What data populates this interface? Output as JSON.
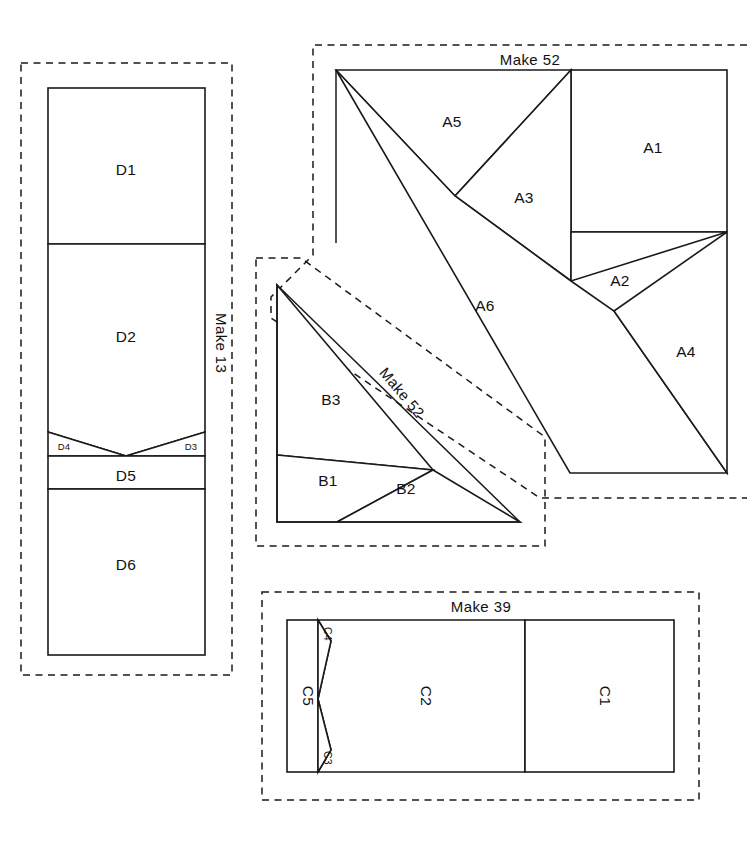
{
  "document": {
    "kind": "quilt-block-cutting-diagram",
    "width": 747,
    "height": 850,
    "background_color": "#ffffff",
    "line_color": "#1a1a1a"
  },
  "blocks": [
    {
      "id": "D",
      "name": "block-d",
      "make_label": "Make 13",
      "make_label_orientation": "vertical",
      "pieces": [
        {
          "id": "D1",
          "label": "D1"
        },
        {
          "id": "D2",
          "label": "D2"
        },
        {
          "id": "D4",
          "label": "D4"
        },
        {
          "id": "D3",
          "label": "D3"
        },
        {
          "id": "D5",
          "label": "D5"
        },
        {
          "id": "D6",
          "label": "D6"
        }
      ]
    },
    {
      "id": "A",
      "name": "block-a",
      "make_label": "Make 52",
      "make_label_orientation": "horizontal",
      "pieces": [
        {
          "id": "A5",
          "label": "A5"
        },
        {
          "id": "A1",
          "label": "A1"
        },
        {
          "id": "A3",
          "label": "A3"
        },
        {
          "id": "A2",
          "label": "A2"
        },
        {
          "id": "A6",
          "label": "A6"
        },
        {
          "id": "A4",
          "label": "A4"
        }
      ]
    },
    {
      "id": "B",
      "name": "block-b",
      "make_label": "Make 52",
      "make_label_orientation": "diagonal",
      "pieces": [
        {
          "id": "B3",
          "label": "B3"
        },
        {
          "id": "B1",
          "label": "B1"
        },
        {
          "id": "B2",
          "label": "B2"
        }
      ]
    },
    {
      "id": "C",
      "name": "block-c",
      "make_label": "Make 39",
      "make_label_orientation": "horizontal",
      "pieces": [
        {
          "id": "C5",
          "label": "C5"
        },
        {
          "id": "C4",
          "label": "C4"
        },
        {
          "id": "C3",
          "label": "C3"
        },
        {
          "id": "C2",
          "label": "C2"
        },
        {
          "id": "C1",
          "label": "C1"
        }
      ]
    }
  ],
  "labels": {
    "make_13": "Make 13",
    "make_52_a": "Make 52",
    "make_52_b": "Make 52",
    "make_39": "Make 39",
    "D1": "D1",
    "D2": "D2",
    "D3": "D3",
    "D4": "D4",
    "D5": "D5",
    "D6": "D6",
    "A1": "A1",
    "A2": "A2",
    "A3": "A3",
    "A4": "A4",
    "A5": "A5",
    "A6": "A6",
    "B1": "B1",
    "B2": "B2",
    "B3": "B3",
    "C1": "C1",
    "C2": "C2",
    "C3": "C3",
    "C4": "C4",
    "C5": "C5"
  }
}
